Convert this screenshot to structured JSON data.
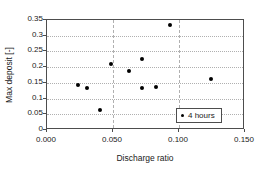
{
  "chart_data": {
    "type": "scatter",
    "title": "",
    "xlabel": "Discharge ratio",
    "ylabel": "Max deposit [-]",
    "xlim": [
      0.0,
      0.15
    ],
    "ylim": [
      0.0,
      0.35
    ],
    "xticks": [
      0.0,
      0.05,
      0.1,
      0.15
    ],
    "xtick_labels": [
      "0.000",
      "0.050",
      "0.100",
      "0.150"
    ],
    "yticks": [
      0,
      0.05,
      0.1,
      0.15,
      0.2,
      0.25,
      0.3,
      0.35
    ],
    "ytick_labels": [
      "0",
      "0.05",
      "0.1",
      "0.15",
      "0.2",
      "0.25",
      "0.3",
      "0.35"
    ],
    "grid": true,
    "grid_color": "#b0b0b0",
    "marker_color": "#000000",
    "axis_color": "#4d4d4d",
    "legend_position": "lower right",
    "legend": [
      "4 hours"
    ],
    "series": [
      {
        "name": "4 hours",
        "x": [
          0.024,
          0.031,
          0.041,
          0.049,
          0.063,
          0.073,
          0.073,
          0.083,
          0.094,
          0.125
        ],
        "y": [
          0.139,
          0.129,
          0.061,
          0.206,
          0.186,
          0.129,
          0.222,
          0.134,
          0.33,
          0.16
        ]
      }
    ]
  }
}
